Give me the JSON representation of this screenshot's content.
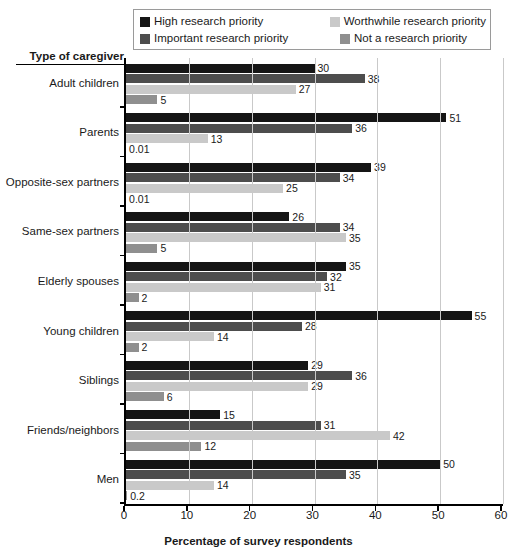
{
  "legend": {
    "items": [
      {
        "label": "High research priority",
        "color": "#151515",
        "swatch_name": "legend-swatch-high"
      },
      {
        "label": "Worthwhile research priority",
        "color": "#c9c9c9",
        "swatch_name": "legend-swatch-worthwhile"
      },
      {
        "label": "Important research priority",
        "color": "#4d4d4d",
        "swatch_name": "legend-swatch-important"
      },
      {
        "label": "Not a research priority",
        "color": "#8f8f8f",
        "swatch_name": "legend-swatch-not"
      }
    ]
  },
  "axes": {
    "y_title": "Type of caregiver",
    "x_title": "Percentage of survey respondents",
    "x_ticks": [
      "0",
      "10",
      "20",
      "30",
      "40",
      "50",
      "60"
    ]
  },
  "chart_data": {
    "type": "bar",
    "orientation": "horizontal",
    "title": "",
    "xlabel": "Percentage of survey respondents",
    "ylabel": "Type of caregiver",
    "xlim": [
      0,
      60
    ],
    "xticks": [
      0,
      10,
      20,
      30,
      40,
      50,
      60
    ],
    "grid": "vertical",
    "legend_position": "top",
    "categories": [
      "Adult children",
      "Parents",
      "Opposite-sex partners",
      "Same-sex partners",
      "Elderly spouses",
      "Young children",
      "Siblings",
      "Friends/neighbors",
      "Men"
    ],
    "series": [
      {
        "name": "High research priority",
        "color": "#151515",
        "values": [
          30,
          51,
          39,
          26,
          35,
          55,
          29,
          15,
          50
        ],
        "labels": [
          "30",
          "51",
          "39",
          "26",
          "35",
          "55",
          "29",
          "15",
          "50"
        ]
      },
      {
        "name": "Important research priority",
        "color": "#4d4d4d",
        "values": [
          38,
          36,
          34,
          34,
          32,
          28,
          36,
          31,
          35
        ],
        "labels": [
          "38",
          "36",
          "34",
          "34",
          "32",
          "28",
          "36",
          "31",
          "35"
        ]
      },
      {
        "name": "Worthwhile research priority",
        "color": "#c9c9c9",
        "values": [
          27,
          13,
          25,
          35,
          31,
          14,
          29,
          42,
          14
        ],
        "labels": [
          "27",
          "13",
          "25",
          "35",
          "31",
          "14",
          "29",
          "42",
          "14"
        ]
      },
      {
        "name": "Not a research priority",
        "color": "#8f8f8f",
        "values": [
          5,
          0.01,
          0.01,
          5,
          2,
          2,
          6,
          12,
          0.2
        ],
        "labels": [
          "5",
          "0.01",
          "0.01",
          "5",
          "2",
          "2",
          "6",
          "12",
          "0.2"
        ]
      }
    ]
  }
}
